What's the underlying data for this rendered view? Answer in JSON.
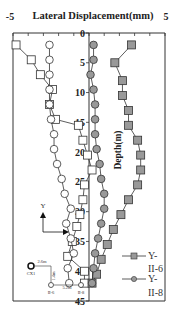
{
  "chart_data": {
    "type": "line",
    "title": "Lateral Displacement(mm)",
    "xlabel": "Lateral Displacement(mm)",
    "ylabel": "Depth(m)",
    "xlim": [
      -5,
      5
    ],
    "ylim": [
      0,
      45
    ],
    "y_inverted": true,
    "x_tick_labels": [
      "-5",
      "0",
      "5"
    ],
    "y_tick_labels": [
      "0",
      "5",
      "10",
      "15",
      "20",
      "25",
      "30",
      "35",
      "40",
      "45"
    ],
    "grid": false,
    "legend_position": "lower right",
    "legend": [
      "Y-II-6",
      "Y-II-8"
    ],
    "series": [
      {
        "name": "open-squares",
        "marker": "square-open",
        "depth": [
          2,
          4.5,
          7,
          9.5,
          12,
          14.5,
          15.5,
          18,
          20.5,
          23,
          25.5,
          28,
          30.5,
          32.5,
          35,
          37.5,
          40,
          42
        ],
        "values": [
          -4.8,
          -3.8,
          -3.2,
          -2.4,
          -2.6,
          -2.2,
          -0.7,
          -0.4,
          -0.1,
          0.2,
          -0.3,
          -0.4,
          -0.6,
          -0.8,
          -1.1,
          -1.4,
          -0.3,
          -0.3
        ]
      },
      {
        "name": "open-circles",
        "marker": "circle-open",
        "depth": [
          2,
          4.5,
          7,
          9.5,
          12,
          14.5,
          17,
          19.5,
          22,
          24.5,
          27,
          29.5,
          32,
          34.5,
          37,
          39.5,
          42
        ],
        "values": [
          -2.6,
          -2.6,
          -2.6,
          -2.6,
          -2.6,
          -2.5,
          -2.3,
          -2.3,
          -2.1,
          -1.8,
          -1.6,
          -1.2,
          -1.5,
          -1.2,
          -1.0,
          -1.4,
          -1.3
        ]
      },
      {
        "name": "Y-II-6",
        "marker": "square-filled",
        "depth": [
          2,
          5,
          8,
          10.5,
          13,
          15.5,
          18,
          20.5,
          23,
          25.5,
          28,
          30.5,
          33,
          35.5,
          38,
          40.5,
          42
        ],
        "values": [
          2.8,
          1.7,
          2.2,
          2.2,
          2.6,
          2.6,
          3.2,
          3.4,
          3.4,
          3.2,
          2.6,
          2.1,
          1.6,
          1.2,
          0.8,
          0.5,
          0.2
        ]
      },
      {
        "name": "Y-II-8",
        "marker": "circle-filled",
        "depth": [
          2,
          4.5,
          7,
          9.5,
          12,
          14.5,
          17,
          19.5,
          22,
          24.5,
          27,
          29.5,
          32,
          34.5,
          37,
          39.5,
          42
        ],
        "values": [
          0.3,
          0.3,
          0.1,
          0.3,
          0.4,
          0.4,
          0.4,
          0.5,
          0.7,
          0.8,
          1.0,
          1.0,
          0.8,
          0.6,
          0.4,
          0.3,
          0.2
        ]
      }
    ],
    "annotations": {
      "direction_arrow_label": "Y",
      "inset_labels": [
        "CX1",
        "2.6m",
        "II-6",
        "5.2m",
        "II-8",
        "1.4m"
      ]
    }
  },
  "labels": {
    "title": "Lateral Displacement(mm)",
    "x_min": "-5",
    "x_max": "5",
    "ylabel": "Depth(m)",
    "legend_1_a": "Y-",
    "legend_1_b": "II-6",
    "legend_2_a": "Y-",
    "legend_2_b": "II-8",
    "arrow_y": "Y",
    "inset_cx1": "CX1",
    "inset_26": "2.6m",
    "inset_ii6": "II-6",
    "inset_52": "5.2m",
    "inset_ii8": "II-8",
    "inset_14": "1.4m",
    "ticks": [
      "0",
      "5",
      "10",
      "15",
      "20",
      "25",
      "30",
      "35",
      "40",
      "45"
    ]
  }
}
